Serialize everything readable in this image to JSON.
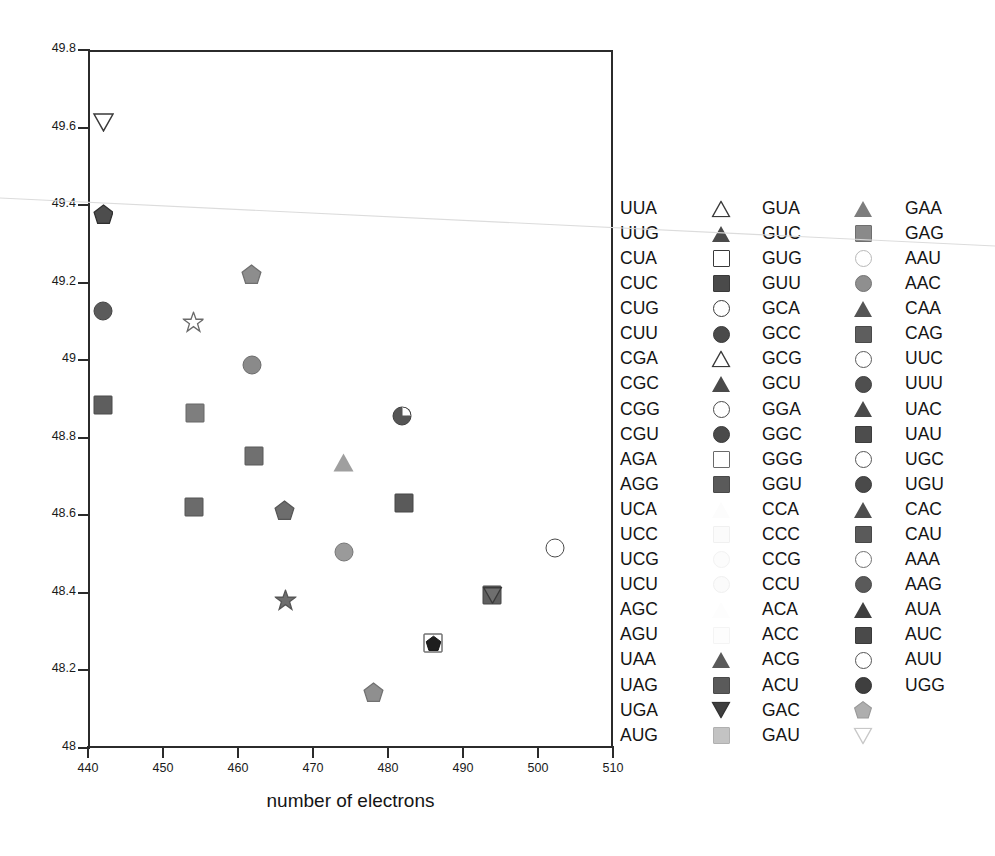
{
  "chart_data": {
    "type": "scatter",
    "title": "",
    "xlabel": "number of electrons",
    "ylabel": "",
    "xlim": [
      440,
      510
    ],
    "ylim": [
      48,
      49.8
    ],
    "xticks": [
      440,
      450,
      460,
      470,
      480,
      490,
      500,
      510
    ],
    "yticks": [
      "48",
      "48.2",
      "48.4",
      "48.6",
      "48.8",
      "49",
      "49.2",
      "49.4",
      "49.6",
      "49.8"
    ],
    "grid": false,
    "legend_position": "right",
    "points": [
      {
        "label": "UGA",
        "x": 442.0,
        "y": 49.612,
        "shape": "triangle-down",
        "fill": "#ffffff",
        "stroke": "#3a3a3a"
      },
      {
        "label": "GAU",
        "x": 442.0,
        "y": 49.375,
        "shape": "pentagon",
        "fill": "#4d4d4d",
        "stroke": "#2e2e2e"
      },
      {
        "label": "CUU",
        "x": 442.0,
        "y": 49.128,
        "shape": "circle",
        "fill": "#5b5b5b",
        "stroke": "#444444"
      },
      {
        "label": "CUC",
        "x": 442.0,
        "y": 48.885,
        "shape": "square",
        "fill": "#5e5e5e",
        "stroke": "#4a4a4a"
      },
      {
        "label": "GCA",
        "x": 461.8,
        "y": 49.222,
        "shape": "pentagon",
        "fill": "#8d8d8d",
        "stroke": "#6f6f6f"
      },
      {
        "label": "CGG",
        "x": 454.0,
        "y": 49.098,
        "shape": "star",
        "fill": "#ffffff",
        "stroke": "#6a6a6a"
      },
      {
        "label": "GCU",
        "x": 461.9,
        "y": 48.988,
        "shape": "circle",
        "fill": "#8a8a8a",
        "stroke": "#6c6c6c"
      },
      {
        "label": "AGG",
        "x": 454.2,
        "y": 48.865,
        "shape": "square",
        "fill": "#7e7e7e",
        "stroke": "#666666"
      },
      {
        "label": "GGC",
        "x": 462.1,
        "y": 48.752,
        "shape": "square",
        "fill": "#707070",
        "stroke": "#585858"
      },
      {
        "label": "GUA",
        "x": 474.0,
        "y": 48.737,
        "shape": "triangle-up",
        "fill": "#9f9f9f",
        "stroke": "#7d7d7d"
      },
      {
        "label": "AUC",
        "x": 481.9,
        "y": 48.857,
        "shape": "pie",
        "fill": "#555555",
        "stroke": "#3f3f3f"
      },
      {
        "label": "GGU",
        "x": 454.1,
        "y": 48.622,
        "shape": "square",
        "fill": "#6b6b6b",
        "stroke": "#545454"
      },
      {
        "label": "CCA",
        "x": 466.2,
        "y": 48.612,
        "shape": "pentagon",
        "fill": "#6d6d6d",
        "stroke": "#565656"
      },
      {
        "label": "CAG",
        "x": 482.1,
        "y": 48.632,
        "shape": "square",
        "fill": "#5a5a5a",
        "stroke": "#464646"
      },
      {
        "label": "CCG",
        "x": 474.1,
        "y": 48.505,
        "shape": "circle",
        "fill": "#9a9a9a",
        "stroke": "#777777"
      },
      {
        "label": "AAA",
        "x": 502.2,
        "y": 48.515,
        "shape": "circle",
        "fill": "#ffffff",
        "stroke": "#4a4a4a"
      },
      {
        "label": "ACG",
        "x": 466.3,
        "y": 48.38,
        "shape": "star",
        "fill": "#6e6e6e",
        "stroke": "#565656"
      },
      {
        "label": "UAU",
        "x": 493.9,
        "y": 48.394,
        "shape": "square-tri",
        "fill": "#5f5f5f",
        "stroke": "#474747"
      },
      {
        "label": "CCU",
        "x": 486.0,
        "y": 48.27,
        "shape": "square-pent",
        "fill": "#2a2a2a",
        "stroke": "#222222"
      },
      {
        "label": "CCC",
        "x": 478.1,
        "y": 48.143,
        "shape": "pentagon",
        "fill": "#8f8f8f",
        "stroke": "#717171"
      }
    ]
  },
  "legend": {
    "columns": [
      {
        "name": "legend-column-1",
        "entries": [
          {
            "label": "UUA",
            "shape": "triangle-up",
            "fill": "#ffffff",
            "stroke": "#3a3a3a"
          },
          {
            "label": "UUG",
            "shape": "triangle-up",
            "fill": "#4a4a4a",
            "stroke": "#3a3a3a"
          },
          {
            "label": "CUA",
            "shape": "square",
            "fill": "#ffffff",
            "stroke": "#3a3a3a"
          },
          {
            "label": "CUC",
            "shape": "square",
            "fill": "#4a4a4a",
            "stroke": "#3a3a3a"
          },
          {
            "label": "CUG",
            "shape": "circle",
            "fill": "#ffffff",
            "stroke": "#3a3a3a"
          },
          {
            "label": "CUU",
            "shape": "circle",
            "fill": "#4a4a4a",
            "stroke": "#3a3a3a"
          },
          {
            "label": "CGA",
            "shape": "triangle-up",
            "fill": "#ffffff",
            "stroke": "#3a3a3a"
          },
          {
            "label": "CGC",
            "shape": "triangle-up",
            "fill": "#4a4a4a",
            "stroke": "#3a3a3a"
          },
          {
            "label": "CGG",
            "shape": "circle",
            "fill": "#ffffff",
            "stroke": "#4a4a4a"
          },
          {
            "label": "CGU",
            "shape": "circle",
            "fill": "#4a4a4a",
            "stroke": "#3a3a3a"
          },
          {
            "label": "AGA",
            "shape": "square",
            "fill": "#ffffff",
            "stroke": "#6a6a6a"
          },
          {
            "label": "AGG",
            "shape": "square",
            "fill": "#5a5a5a",
            "stroke": "#4a4a4a"
          },
          {
            "label": "UCA",
            "shape": "triangle-up",
            "fill": "#fcfcfc",
            "stroke": "#f2f2f2"
          },
          {
            "label": "UCC",
            "shape": "square",
            "fill": "#fbfbfb",
            "stroke": "#f0f0f0"
          },
          {
            "label": "UCG",
            "shape": "circle",
            "fill": "#fcfcfc",
            "stroke": "#f2f2f2"
          },
          {
            "label": "UCU",
            "shape": "circle",
            "fill": "#fbfbfb",
            "stroke": "#f0f0f0"
          },
          {
            "label": "AGC",
            "shape": "triangle-up",
            "fill": "#fdfdfd",
            "stroke": "#f4f4f4"
          },
          {
            "label": "AGU",
            "shape": "square",
            "fill": "#fdfdfd",
            "stroke": "#f4f4f4"
          },
          {
            "label": "UAA",
            "shape": "triangle-up",
            "fill": "#5a5a5a",
            "stroke": "#4a4a4a"
          },
          {
            "label": "UAG",
            "shape": "square",
            "fill": "#5a5a5a",
            "stroke": "#4a4a4a"
          },
          {
            "label": "UGA",
            "shape": "triangle-down",
            "fill": "#3f3f3f",
            "stroke": "#333333"
          },
          {
            "label": "AUG",
            "shape": "square",
            "fill": "#c3c3c3",
            "stroke": "#b0b0b0"
          }
        ]
      },
      {
        "name": "legend-column-2",
        "entries": [
          {
            "label": "GUA",
            "shape": "triangle-up",
            "fill": "#7d7d7d",
            "stroke": "#666666"
          },
          {
            "label": "GUC",
            "shape": "square",
            "fill": "#8a8a8a",
            "stroke": "#6f6f6f"
          },
          {
            "label": "GUG",
            "shape": "circle",
            "fill": "#ffffff",
            "stroke": "#b8b8b8"
          },
          {
            "label": "GUU",
            "shape": "circle",
            "fill": "#8f8f8f",
            "stroke": "#737373"
          },
          {
            "label": "GCA",
            "shape": "triangle-up",
            "fill": "#555555",
            "stroke": "#444444"
          },
          {
            "label": "GCC",
            "shape": "square",
            "fill": "#5e5e5e",
            "stroke": "#4a4a4a"
          },
          {
            "label": "GCG",
            "shape": "circle",
            "fill": "#ffffff",
            "stroke": "#5a5a5a"
          },
          {
            "label": "GCU",
            "shape": "circle",
            "fill": "#4f4f4f",
            "stroke": "#3f3f3f"
          },
          {
            "label": "GGA",
            "shape": "triangle-up",
            "fill": "#4a4a4a",
            "stroke": "#3a3a3a"
          },
          {
            "label": "GGC",
            "shape": "square",
            "fill": "#4d4d4d",
            "stroke": "#3d3d3d"
          },
          {
            "label": "GGG",
            "shape": "circle",
            "fill": "#ffffff",
            "stroke": "#555555"
          },
          {
            "label": "GGU",
            "shape": "circle",
            "fill": "#4a4a4a",
            "stroke": "#3a3a3a"
          },
          {
            "label": "CCA",
            "shape": "triangle-up",
            "fill": "#4f4f4f",
            "stroke": "#3f3f3f"
          },
          {
            "label": "CCC",
            "shape": "square",
            "fill": "#5a5a5a",
            "stroke": "#484848"
          },
          {
            "label": "CCG",
            "shape": "circle",
            "fill": "#ffffff",
            "stroke": "#707070"
          },
          {
            "label": "CCU",
            "shape": "circle",
            "fill": "#5a5a5a",
            "stroke": "#484848"
          },
          {
            "label": "ACA",
            "shape": "triangle-up",
            "fill": "#3f3f3f",
            "stroke": "#333333"
          },
          {
            "label": "ACC",
            "shape": "square",
            "fill": "#4a4a4a",
            "stroke": "#3a3a3a"
          },
          {
            "label": "ACG",
            "shape": "circle",
            "fill": "#ffffff",
            "stroke": "#555555"
          },
          {
            "label": "ACU",
            "shape": "circle",
            "fill": "#3f3f3f",
            "stroke": "#333333"
          },
          {
            "label": "GAC",
            "shape": "pentagon",
            "fill": "#aeaeae",
            "stroke": "#999999"
          },
          {
            "label": "GAU",
            "shape": "triangle-down",
            "fill": "#ffffff",
            "stroke": "#c8c8c8"
          }
        ]
      },
      {
        "name": "legend-column-3",
        "entries": [
          {
            "label": "GAA"
          },
          {
            "label": "GAG"
          },
          {
            "label": "AAU"
          },
          {
            "label": "AAC"
          },
          {
            "label": "CAA"
          },
          {
            "label": "CAG"
          },
          {
            "label": "UUC"
          },
          {
            "label": "UUU"
          },
          {
            "label": "UAC"
          },
          {
            "label": "UAU"
          },
          {
            "label": "UGC"
          },
          {
            "label": "UGU"
          },
          {
            "label": "CAC"
          },
          {
            "label": "CAU"
          },
          {
            "label": "AAA"
          },
          {
            "label": "AAG"
          },
          {
            "label": "AUA"
          },
          {
            "label": "AUC"
          },
          {
            "label": "AUU"
          },
          {
            "label": "UGG"
          }
        ]
      }
    ]
  },
  "colors": {
    "axis": "#2b2b2b",
    "text": "#1a1a1a",
    "background": "#ffffff",
    "artifact_line": "#d9d9d9"
  }
}
